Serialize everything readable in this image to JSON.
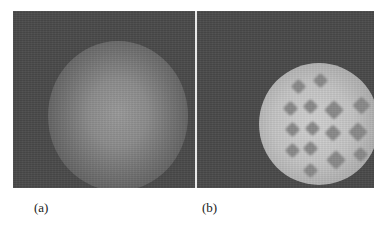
{
  "figure": {
    "panels": [
      {
        "id": "a",
        "label": "(a)",
        "description": "diffuse bright circular glow centered on dark noisy background"
      },
      {
        "id": "b",
        "label": "(b)",
        "description": "bright circular disc at right with grid of dark diamond-shaped spots"
      }
    ]
  },
  "colors": {
    "background": "#4a4a4a",
    "glow": "#9a9a9a",
    "disc": "#d2d2d2",
    "spots": "#8a8a8a",
    "divider": "#e8e8e8"
  }
}
